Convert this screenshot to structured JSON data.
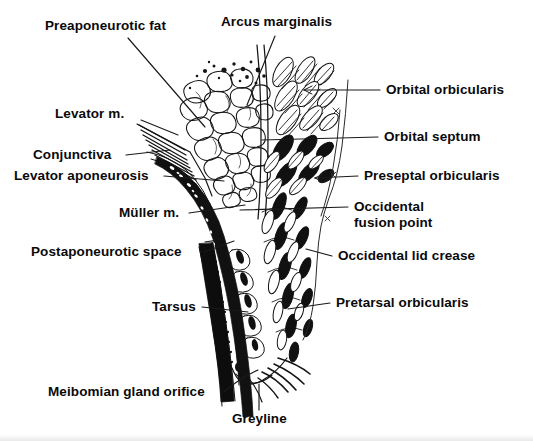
{
  "figure": {
    "background_color": "#ffffff",
    "ink_color": "#111111",
    "label_color": "#0a0a0a"
  },
  "labels": {
    "preaponeurotic_fat": "Preaponeurotic fat",
    "arcus_marginalis": "Arcus marginalis",
    "levator_m": "Levator m.",
    "conjunctiva": "Conjunctiva",
    "levator_aponeurosis": "Levator aponeurosis",
    "muller_m": "Müller m.",
    "postaponeurotic_space": "Postaponeurotic space",
    "tarsus": "Tarsus",
    "meibomian_gland_orifice": "Meibomian gland orifice",
    "greyline": "Greyline",
    "orbital_orbicularis": "Orbital orbicularis",
    "orbital_septum": "Orbital septum",
    "preseptal_orbicularis": "Preseptal orbicularis",
    "occidental_fusion_point_line1": "Occidental",
    "occidental_fusion_point_line2": "fusion point",
    "occidental_lid_crease": "Occidental lid crease",
    "pretarsal_orbicularis": "Pretarsal orbicularis"
  },
  "structures": [
    {
      "name": "preaponeurotic-fat",
      "side": "left",
      "description": "lobulated fat pad, open bubble outlines"
    },
    {
      "name": "arcus-marginalis",
      "side": "top-center",
      "description": "periosteal fusion at orbital rim"
    },
    {
      "name": "levator-muscle",
      "side": "left",
      "description": "striated muscle fibers entering superiorly"
    },
    {
      "name": "conjunctiva",
      "side": "left",
      "description": "thin posterior lining membrane"
    },
    {
      "name": "levator-aponeurosis",
      "side": "left",
      "description": "fibrous sheet descending to tarsus"
    },
    {
      "name": "muller-muscle",
      "side": "left",
      "description": "smooth muscle band, dark"
    },
    {
      "name": "postaponeurotic-space",
      "side": "left",
      "description": "potential space behind aponeurosis"
    },
    {
      "name": "tarsus",
      "side": "left",
      "description": "dense fibrous plate with meibomian glands"
    },
    {
      "name": "meibomian-gland-orifice",
      "side": "bottom-left",
      "description": "duct opening at lid margin"
    },
    {
      "name": "greyline",
      "side": "bottom-center",
      "description": "muscle of Riolan at lid margin"
    },
    {
      "name": "orbital-orbicularis",
      "side": "right",
      "description": "outermost orbicularis bundles"
    },
    {
      "name": "orbital-septum",
      "side": "right",
      "description": "septal sheet from arcus marginalis"
    },
    {
      "name": "preseptal-orbicularis",
      "side": "right",
      "description": "mid orbicularis bundles"
    },
    {
      "name": "occidental-fusion-point",
      "side": "right",
      "description": "septum / aponeurosis fusion"
    },
    {
      "name": "occidental-lid-crease",
      "side": "right",
      "description": "skin crease indentation"
    },
    {
      "name": "pretarsal-orbicularis",
      "side": "right",
      "description": "orbicularis over tarsal plate"
    }
  ]
}
